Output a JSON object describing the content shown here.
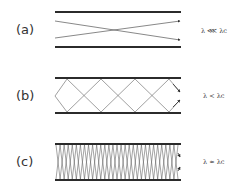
{
  "colors": {
    "wall": "#2b2b2b",
    "ray": "#555555",
    "text": "#333333",
    "background": "#ffffff"
  },
  "panels": [
    {
      "id": "a",
      "label": "(a)",
      "condition": "λ ⋘ λc",
      "description": "two rays crossing once, nearly parallel to walls"
    },
    {
      "id": "b",
      "label": "(b)",
      "condition": "λ < λc",
      "description": "zigzag rays reflecting between walls"
    },
    {
      "id": "c",
      "label": "(c)",
      "condition": "λ ≈ λc",
      "description": "dense zigzag rays, nearly perpendicular to walls"
    }
  ]
}
